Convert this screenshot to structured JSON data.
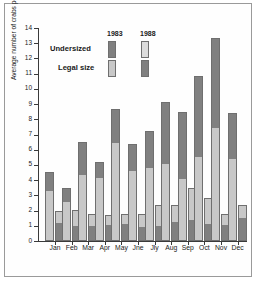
{
  "chart_data": {
    "type": "bar",
    "title": "",
    "xlabel": "",
    "ylabel": "Average number of crabs per lift",
    "ylim": [
      0,
      14
    ],
    "yticks": [
      0,
      1,
      2,
      3,
      4,
      5,
      6,
      7,
      8,
      9,
      10,
      11,
      12,
      13,
      14
    ],
    "grid": false,
    "legend_position": "top-center",
    "stacked": true,
    "grouped": true,
    "categories": [
      "Jan",
      "Feb",
      "Mar",
      "Apr",
      "May",
      "Jne",
      "Jly",
      "Aug",
      "Sep",
      "Oct",
      "Nov",
      "Dec"
    ],
    "group_names": [
      "1983",
      "1988"
    ],
    "stack_names": [
      "Legal size",
      "Undersized"
    ],
    "series": [
      {
        "name": "1983 Legal size",
        "group": "1983",
        "stack": "Legal size",
        "values": [
          3.35,
          2.6,
          4.35,
          4.15,
          6.5,
          4.65,
          4.8,
          5.1,
          4.05,
          5.55,
          7.45,
          5.4
        ]
      },
      {
        "name": "1983 Undersized",
        "group": "1983",
        "stack": "Undersized",
        "values": [
          1.2,
          0.9,
          2.15,
          1.05,
          2.15,
          1.7,
          2.4,
          4.05,
          4.45,
          5.3,
          5.9,
          3.0
        ]
      },
      {
        "name": "1988 Legal size",
        "group": "1988",
        "stack": "Legal size",
        "values": [
          1.2,
          1.0,
          1.0,
          1.05,
          1.15,
          0.95,
          1.0,
          1.25,
          1.35,
          1.1,
          1.05,
          1.5
        ]
      },
      {
        "name": "1988 Undersized",
        "group": "1988",
        "stack": "Undersized",
        "values": [
          0.75,
          1.05,
          0.75,
          0.65,
          0.65,
          0.85,
          1.4,
          1.1,
          2.15,
          1.75,
          0.7,
          0.85
        ]
      }
    ],
    "totals_1983": [
      4.55,
      3.5,
      6.5,
      5.2,
      8.65,
      6.35,
      7.2,
      9.15,
      8.5,
      10.85,
      13.35,
      8.4
    ],
    "totals_1988": [
      1.95,
      2.05,
      1.75,
      1.7,
      1.8,
      1.8,
      2.4,
      2.35,
      3.5,
      2.85,
      1.75,
      2.35
    ]
  },
  "legend": {
    "col_1983": "1983",
    "col_1988": "1988",
    "row_undersized": "Undersized",
    "row_legal": "Legal size"
  },
  "colors": {
    "dark": "#808080",
    "light": "#c8c8c8",
    "axis": "#3a3a3a",
    "outline": "#6f6f6f",
    "background": "#ffffff"
  }
}
